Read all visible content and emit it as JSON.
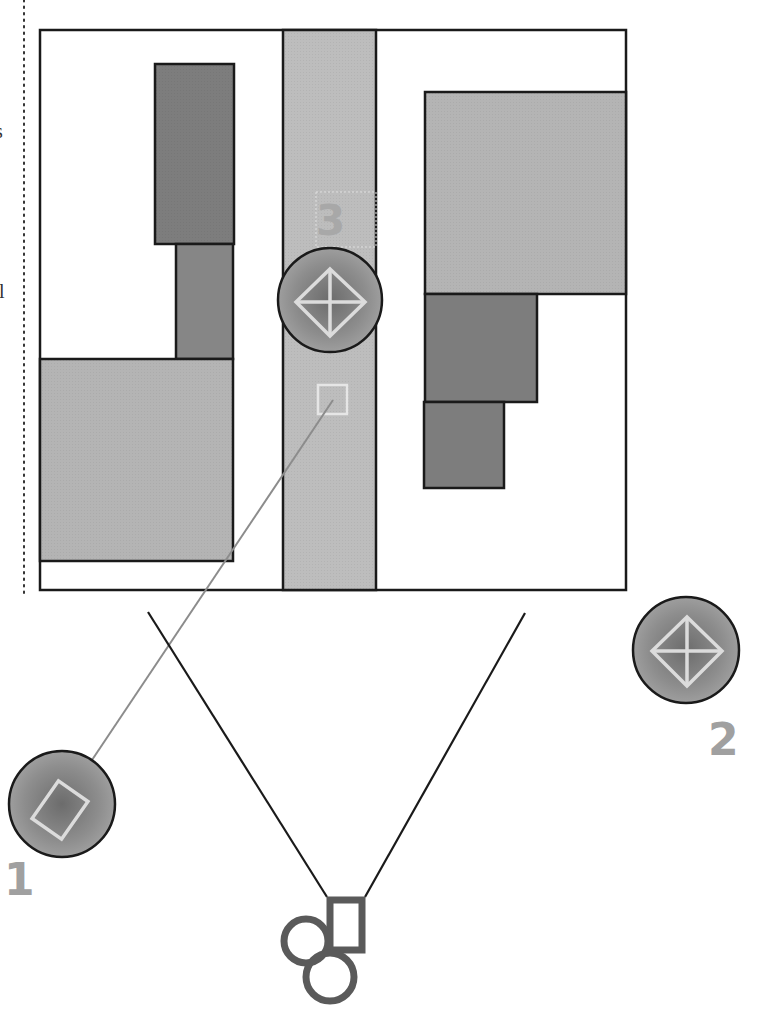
{
  "diagram": {
    "colors": {
      "background": "#ffffff",
      "outline": "#1a1a1a",
      "light_block": "#b4b4b4",
      "medium_block": "#7d7d7d",
      "street": "#bdbdbd",
      "target_fill": "#8a8a8a",
      "target_glyph": "#d9d9d9",
      "label": "#a0a0a0",
      "camera_icon": "#5a5a5a",
      "sight_line": "#8c8c8c",
      "fov_line": "#1a1a1a",
      "dotted_guide": "#333333"
    },
    "margin_fragments": [
      {
        "text": "s",
        "x": 0,
        "y": 121
      },
      {
        "text": "l",
        "x": 0,
        "y": 281
      }
    ],
    "area": {
      "x": 40,
      "y": 30,
      "width": 586,
      "height": 560
    },
    "street": {
      "x": 283,
      "y": 30,
      "width": 93,
      "height": 560
    },
    "buildings": [
      {
        "name": "left-upper-tower",
        "x": 155,
        "y": 64,
        "width": 79,
        "height": 180,
        "shade": "medium"
      },
      {
        "name": "left-middle-block",
        "x": 176,
        "y": 244,
        "width": 57,
        "height": 115,
        "shade": "medium"
      },
      {
        "name": "left-lower-block",
        "x": 40,
        "y": 359,
        "width": 193,
        "height": 202,
        "shade": "light"
      },
      {
        "name": "right-upper-block",
        "x": 425,
        "y": 92,
        "width": 201,
        "height": 202,
        "shade": "light"
      },
      {
        "name": "right-middle-block",
        "x": 425,
        "y": 294,
        "width": 112,
        "height": 108,
        "shade": "medium"
      },
      {
        "name": "right-lower-block",
        "x": 424,
        "y": 402,
        "width": 80,
        "height": 86,
        "shade": "medium"
      }
    ],
    "targets": [
      {
        "id": "1",
        "label": "1",
        "shape": "rectangle",
        "cx": 62,
        "cy": 804,
        "r": 53,
        "label_x": 8,
        "label_y": 895
      },
      {
        "id": "2",
        "label": "2",
        "shape": "diamond",
        "cx": 686,
        "cy": 650,
        "r": 53,
        "label_x": 708,
        "label_y": 755
      },
      {
        "id": "3",
        "label": "3",
        "shape": "diamond",
        "cx": 330,
        "cy": 300,
        "r": 53,
        "label_x": 316,
        "label_y": 235
      }
    ],
    "ghost_marker": {
      "x": 317,
      "y": 385,
      "size": 31
    },
    "ghost_label_box": {
      "x": 316,
      "y": 192,
      "width": 60,
      "height": 55
    },
    "sight_line": {
      "x1": 90,
      "y1": 763,
      "x2": 333,
      "y2": 400
    },
    "camera": {
      "label": "camera",
      "fov_left": {
        "x1": 148,
        "y1": 612,
        "x2": 327,
        "y2": 897
      },
      "fov_right": {
        "x1": 525,
        "y1": 613,
        "x2": 365,
        "y2": 897
      }
    }
  }
}
